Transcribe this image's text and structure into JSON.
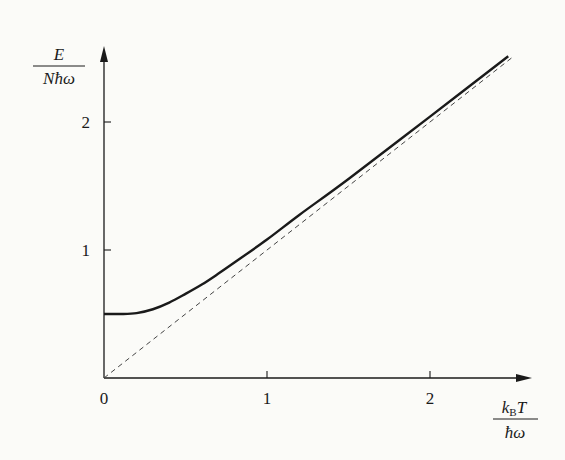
{
  "chart_data": {
    "type": "line",
    "title": "",
    "xlabel": {
      "numerator": "k_B T",
      "numerator_main": "k",
      "numerator_sub": "B",
      "numerator_tail": "T",
      "denominator": "ħω"
    },
    "ylabel": {
      "numerator": "E",
      "denominator": "Nħω"
    },
    "xlim": [
      0,
      2.6
    ],
    "ylim": [
      0,
      2.6
    ],
    "x_ticks": [
      {
        "value": 0,
        "label": "0"
      },
      {
        "value": 1,
        "label": "1"
      },
      {
        "value": 2,
        "label": "2"
      }
    ],
    "y_ticks": [
      {
        "value": 1,
        "label": "1"
      },
      {
        "value": 2,
        "label": "2"
      }
    ],
    "grid": false,
    "legend": null,
    "series": [
      {
        "name": "E/(Nħω) = ½·coth(ħω/2k_BT)",
        "style": "solid",
        "color": "#1a1a1a",
        "x": [
          0,
          0.1,
          0.2,
          0.3,
          0.4,
          0.5,
          0.6,
          0.7,
          0.8,
          1.0,
          1.2,
          1.5,
          2.0,
          2.48
        ],
        "y": [
          0.5,
          0.5,
          0.507,
          0.537,
          0.589,
          0.657,
          0.73,
          0.814,
          0.902,
          1.082,
          1.276,
          1.555,
          2.042,
          2.514
        ]
      },
      {
        "name": "classical limit E/(Nħω) = k_BT/ħω",
        "style": "dashed",
        "color": "#444444",
        "x": [
          0,
          2.5
        ],
        "y": [
          0,
          2.5
        ]
      }
    ]
  },
  "axes": {
    "origin_label": "0"
  }
}
